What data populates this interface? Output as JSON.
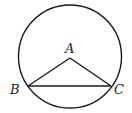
{
  "diagram": {
    "type": "geometry",
    "circle": {
      "cx": 70,
      "cy": 56.5,
      "r": 53
    },
    "points": {
      "A": {
        "label": "A",
        "x": 70,
        "y": 58
      },
      "B": {
        "label": "B",
        "x": 28,
        "y": 86
      },
      "C": {
        "label": "C",
        "x": 111,
        "y": 86
      }
    },
    "segments": [
      [
        "A",
        "B"
      ],
      [
        "A",
        "C"
      ],
      [
        "B",
        "C"
      ]
    ],
    "colors": {
      "stroke": "#1a1a1a",
      "label": "#222222",
      "background": "#ffffff"
    }
  }
}
